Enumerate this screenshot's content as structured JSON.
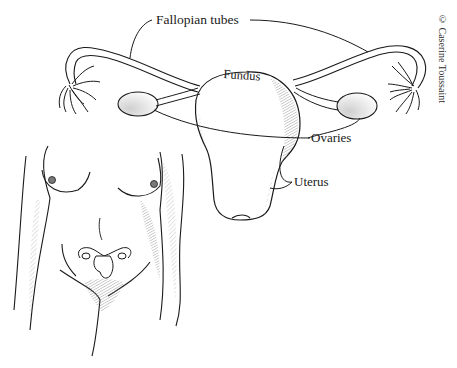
{
  "figure": {
    "labels": {
      "fallopian_tubes": "Fallopian tubes",
      "fundus": "Fundus",
      "ovaries": "Ovaries",
      "uterus": "Uterus"
    },
    "credit": "© Caserine Toussaint",
    "colors": {
      "background": "#ffffff",
      "ink": "#1a1a1a",
      "shading": "#8a8a8a"
    }
  }
}
